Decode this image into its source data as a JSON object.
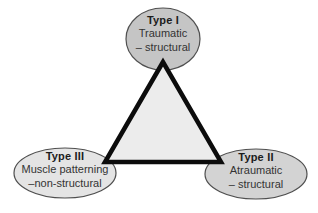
{
  "figure": {
    "type": "triangle-classification-diagram",
    "background_color": "#ffffff",
    "triangle": {
      "fill": "#ececec",
      "stroke": "#0c0c0c"
    },
    "nodes": {
      "top": {
        "title": "Type I",
        "lines": [
          "Traumatic",
          "– structural"
        ],
        "fill": "#c5c5c5",
        "stroke": "#4f4f4f"
      },
      "left": {
        "title": "Type III",
        "lines": [
          "Muscle patterning",
          "–non-structural"
        ],
        "fill": "#e4e4e4",
        "stroke": "#4f4f4f"
      },
      "right": {
        "title": "Type II",
        "lines": [
          "Atraumatic",
          "– structural"
        ],
        "fill": "#d3d3d3",
        "stroke": "#4f4f4f"
      }
    }
  }
}
